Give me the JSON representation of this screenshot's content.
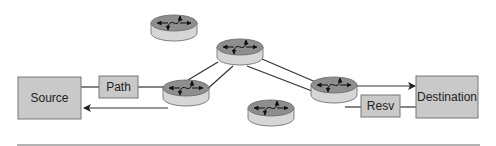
{
  "diagram": {
    "type": "RSVP signaling flow",
    "nodes": {
      "source": {
        "label": "Source"
      },
      "destination": {
        "label": "Destination"
      }
    },
    "messages": {
      "path": {
        "label": "Path"
      },
      "resv": {
        "label": "Resv"
      }
    },
    "routers": [
      {
        "name": "router-top-left"
      },
      {
        "name": "router-source-edge"
      },
      {
        "name": "router-top-middle"
      },
      {
        "name": "router-destination-edge"
      },
      {
        "name": "router-bottom"
      }
    ],
    "colors": {
      "box_fill": "#c9c9c9",
      "box_stroke": "#777777",
      "router_top": "#8f8f8f",
      "router_side": "#d4d4d4",
      "line": "#333333"
    }
  }
}
